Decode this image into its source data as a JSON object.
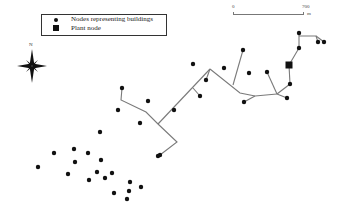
{
  "legend": {
    "items": [
      {
        "symbol": "circle",
        "label": "Nodes representing buildings"
      },
      {
        "symbol": "square",
        "label": "Plant node"
      }
    ]
  },
  "scale_bar": {
    "start": "0",
    "end": "700",
    "unit": "m"
  },
  "north_arrow": {
    "label": "N"
  },
  "colors": {
    "node": "#111111",
    "pipe": "#7a7a7a",
    "background": "#ffffff"
  },
  "network": {
    "plant_node": [
      289,
      65
    ],
    "building_nodes": [
      [
        299,
        33
      ],
      [
        318,
        42
      ],
      [
        324,
        42
      ],
      [
        299,
        48
      ],
      [
        290,
        84
      ],
      [
        287,
        98
      ],
      [
        267,
        72
      ],
      [
        249,
        73
      ],
      [
        243,
        50
      ],
      [
        244,
        102
      ],
      [
        224,
        68
      ],
      [
        206,
        80
      ],
      [
        193,
        64
      ],
      [
        200,
        96
      ],
      [
        174,
        110
      ],
      [
        160,
        155
      ],
      [
        122,
        88
      ],
      [
        148,
        101
      ],
      [
        118,
        110
      ],
      [
        140,
        123
      ],
      [
        100,
        132
      ],
      [
        158,
        156
      ],
      [
        54,
        153
      ],
      [
        74,
        149
      ],
      [
        88,
        153
      ],
      [
        75,
        162
      ],
      [
        101,
        160
      ],
      [
        38,
        167
      ],
      [
        68,
        174
      ],
      [
        97,
        172
      ],
      [
        112,
        173
      ],
      [
        89,
        180
      ],
      [
        105,
        178
      ],
      [
        130,
        182
      ],
      [
        141,
        187
      ],
      [
        129,
        191
      ],
      [
        114,
        193
      ],
      [
        127,
        199
      ]
    ],
    "pipes": [
      [
        [
          299,
          33
        ],
        [
          299,
          48
        ]
      ],
      [
        [
          299,
          36
        ],
        [
          316,
          36
        ],
        [
          318,
          42
        ]
      ],
      [
        [
          316,
          36
        ],
        [
          324,
          42
        ]
      ],
      [
        [
          299,
          48
        ],
        [
          289,
          65
        ]
      ],
      [
        [
          289,
          65
        ],
        [
          290,
          84
        ]
      ],
      [
        [
          290,
          84
        ],
        [
          277,
          94
        ]
      ],
      [
        [
          277,
          94
        ],
        [
          267,
          72
        ]
      ],
      [
        [
          277,
          94
        ],
        [
          287,
          98
        ]
      ],
      [
        [
          277,
          94
        ],
        [
          255,
          96
        ],
        [
          240,
          93
        ],
        [
          210,
          69
        ]
      ],
      [
        [
          255,
          96
        ],
        [
          244,
          102
        ]
      ],
      [
        [
          233,
          85
        ],
        [
          243,
          50
        ]
      ],
      [
        [
          210,
          69
        ],
        [
          206,
          80
        ]
      ],
      [
        [
          210,
          69
        ],
        [
          158,
          124
        ]
      ],
      [
        [
          193,
          88
        ],
        [
          200,
          96
        ]
      ],
      [
        [
          122,
          88
        ],
        [
          121,
          100
        ],
        [
          146,
          112
        ],
        [
          158,
          124
        ],
        [
          177,
          142
        ],
        [
          160,
          155
        ]
      ]
    ]
  }
}
